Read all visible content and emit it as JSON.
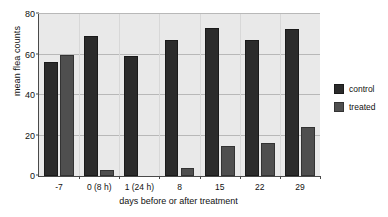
{
  "chart_data": {
    "type": "bar",
    "title": "",
    "xlabel": "days before or after treatment",
    "ylabel": "mean flea counts",
    "categories": [
      "-7",
      "0 (8 h)",
      "1 (24 h)",
      "8",
      "15",
      "22",
      "29"
    ],
    "series": [
      {
        "name": "control",
        "color": "#2b2b2b",
        "values": [
          56.5,
          69,
          59.5,
          67,
          73,
          67,
          72.5
        ]
      },
      {
        "name": "treated",
        "color": "#4f4f4f",
        "values": [
          60,
          3,
          0,
          4,
          15,
          16.5,
          24
        ]
      }
    ],
    "ylim": [
      0,
      80
    ],
    "yticks": [
      0,
      20,
      40,
      60,
      80
    ],
    "ytick_labels": [
      "0",
      "20",
      "40",
      "60",
      "80"
    ],
    "grid": true,
    "grid_axis": "y",
    "legend_position": "right",
    "plot_background": "#e9e9e9",
    "gridline_color": "#b8b8b8",
    "axis_color": "#4a4a4a"
  },
  "legend": {
    "entries": [
      {
        "label": "control"
      },
      {
        "label": "treated"
      }
    ]
  }
}
